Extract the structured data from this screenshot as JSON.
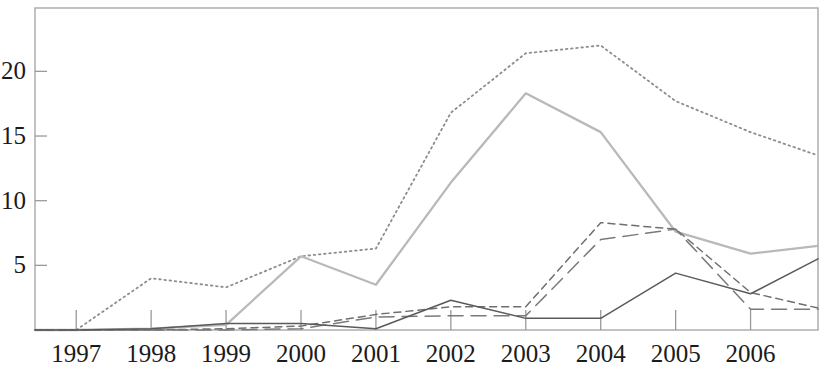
{
  "chart_data": {
    "type": "line",
    "title": "",
    "subtitle": "",
    "xlabel": "",
    "ylabel": "",
    "grid": false,
    "legend": "none",
    "categories": [
      "1997",
      "1998",
      "1999",
      "2000",
      "2001",
      "2002",
      "2003",
      "2004",
      "2005",
      "2006"
    ],
    "x_tick_labels": [
      "1997",
      "1998",
      "1999",
      "2000",
      "2001",
      "2002",
      "2003",
      "2004",
      "2005",
      "2006"
    ],
    "y_tick_labels": [
      "5",
      "10",
      "15",
      "20"
    ],
    "y_tick_values": [
      5,
      10,
      15,
      20
    ],
    "xlim": [
      1996.45,
      2006.9
    ],
    "ylim": [
      0,
      24.9
    ],
    "series": [
      {
        "name": "series-dotted",
        "style": "dotted",
        "color": "#8d8d8d",
        "x": [
          1996.45,
          1997,
          1998,
          1999,
          2000,
          2001,
          2002,
          2003,
          2004,
          2005,
          2006,
          2006.9
        ],
        "values": [
          0,
          0,
          4.0,
          3.3,
          5.7,
          6.3,
          16.8,
          21.4,
          22.0,
          17.7,
          15.3,
          13.5
        ]
      },
      {
        "name": "series-light-gray",
        "style": "solid-light",
        "color": "#b9b9b9",
        "x": [
          1996.45,
          1997,
          1998,
          1999,
          2000,
          2001,
          2002,
          2003,
          2004,
          2005,
          2006,
          2006.9
        ],
        "values": [
          0,
          0,
          0.1,
          0.4,
          5.7,
          3.5,
          11.4,
          18.3,
          15.3,
          7.6,
          5.9,
          6.5
        ]
      },
      {
        "name": "series-short-dash",
        "style": "short-dash",
        "color": "#6f6f6f",
        "x": [
          1996.45,
          1997,
          1998,
          1999,
          2000,
          2001,
          2002,
          2003,
          2004,
          2005,
          2006,
          2006.9
        ],
        "values": [
          0,
          0,
          0,
          0.1,
          0.3,
          1.2,
          1.8,
          1.8,
          8.3,
          7.8,
          2.9,
          1.7
        ]
      },
      {
        "name": "series-long-dash",
        "style": "long-dash",
        "color": "#7a7a7a",
        "x": [
          1996.45,
          1997,
          1998,
          1999,
          2000,
          2001,
          2002,
          2003,
          2004,
          2005,
          2006,
          2006.9
        ],
        "values": [
          0,
          0,
          0,
          0,
          0.1,
          1.0,
          1.1,
          1.1,
          7.0,
          7.8,
          1.6,
          1.6
        ]
      },
      {
        "name": "series-solid-dark",
        "style": "solid",
        "color": "#5a5a5a",
        "x": [
          1996.45,
          1997,
          1998,
          1999,
          2000,
          2001,
          2002,
          2003,
          2004,
          2005,
          2006,
          2006.9
        ],
        "values": [
          0,
          0,
          0.1,
          0.5,
          0.5,
          0.1,
          2.3,
          0.9,
          0.9,
          4.4,
          2.8,
          5.5
        ]
      }
    ]
  },
  "axis": {
    "frame_color": "#a8a8a8",
    "tick_color": "#9a9a9a"
  },
  "ticks": {
    "y": [
      {
        "label": "20",
        "value": 20
      },
      {
        "label": "15",
        "value": 15
      },
      {
        "label": "10",
        "value": 10
      },
      {
        "label": "5",
        "value": 5
      }
    ],
    "x": [
      {
        "label": "1997",
        "value": 1997
      },
      {
        "label": "1998",
        "value": 1998
      },
      {
        "label": "1999",
        "value": 1999
      },
      {
        "label": "2000",
        "value": 2000
      },
      {
        "label": "2001",
        "value": 2001
      },
      {
        "label": "2002",
        "value": 2002
      },
      {
        "label": "2003",
        "value": 2003
      },
      {
        "label": "2004",
        "value": 2004
      },
      {
        "label": "2005",
        "value": 2005
      },
      {
        "label": "2006",
        "value": 2006
      }
    ]
  }
}
